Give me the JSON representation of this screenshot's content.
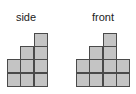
{
  "views": [
    {
      "id": "side",
      "label": "side",
      "label_x": 10,
      "label_width": 32,
      "label_y": 11,
      "origin_x": 7,
      "bottom_y": 86,
      "column_heights": [
        2,
        3,
        4
      ]
    },
    {
      "id": "front",
      "label": "front",
      "label_x": 84,
      "label_width": 38,
      "label_y": 11,
      "origin_x": 76,
      "bottom_y": 86,
      "column_heights": [
        2,
        3,
        4,
        2
      ]
    }
  ],
  "style": {
    "cell_size": 13.3,
    "cell_fill": "#c4c4c4",
    "cell_border": "#4a4a4a"
  }
}
